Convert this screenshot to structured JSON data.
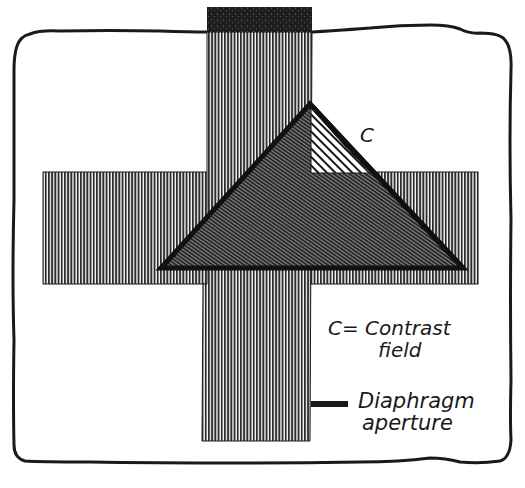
{
  "figure": {
    "width": 525,
    "height": 488,
    "colors": {
      "ink": "#1a1a1a",
      "background": "#ffffff",
      "bar_fill": "#6a6a6a",
      "triangle_fill": "#4a4a4a",
      "cap_fill": "#222222"
    },
    "border": {
      "shape": "wavy-rounded-rectangle",
      "x": 13,
      "y": 30,
      "width": 499,
      "height": 433
    },
    "vertical_bar": {
      "x": 207,
      "y": 32,
      "width": 104,
      "height": 409,
      "pattern": "vertical-lines"
    },
    "top_cap": {
      "x": 207,
      "y": 7,
      "width": 105,
      "height": 25,
      "pattern": "stippled-dark"
    },
    "horizontal_bar": {
      "x": 43,
      "y": 172,
      "width": 435,
      "height": 112,
      "pattern": "vertical-lines"
    },
    "triangle": {
      "apex": [
        310,
        104
      ],
      "base_left": [
        161,
        268
      ],
      "base_right": [
        463,
        268
      ],
      "pattern": "diagonal-fine-lines"
    },
    "contrast_field": {
      "points": [
        [
          310,
          104
        ],
        [
          310,
          173
        ],
        [
          370,
          173
        ]
      ],
      "pattern": "diagonal-open-hatch"
    }
  },
  "labels": {
    "c_marker": "C",
    "legend_contrast_line1": "C= Contrast",
    "legend_contrast_line2": "field",
    "legend_diaphragm_line1": "Diaphragm",
    "legend_diaphragm_line2": "aperture"
  }
}
